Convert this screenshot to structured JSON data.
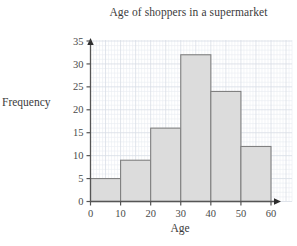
{
  "chart_data": {
    "type": "bar",
    "title": "Age of shoppers in a supermarket",
    "xlabel": "Age",
    "ylabel": "Frequency",
    "categories": [
      "0-10",
      "10-20",
      "20-30",
      "30-40",
      "40-50",
      "50-60"
    ],
    "bin_edges": [
      0,
      10,
      20,
      30,
      40,
      50,
      60
    ],
    "values": [
      5,
      9,
      16,
      32,
      24,
      12
    ],
    "xlim": [
      0,
      67
    ],
    "ylim": [
      0,
      38
    ],
    "xticks": [
      0,
      10,
      20,
      30,
      40,
      50,
      60
    ],
    "yticks": [
      0,
      5,
      10,
      15,
      20,
      25,
      30,
      35
    ],
    "xtick_labels": [
      "0",
      "10",
      "20",
      "30",
      "40",
      "50",
      "60"
    ],
    "ytick_labels": [
      "0",
      "5",
      "10",
      "15",
      "20",
      "25",
      "30",
      "35"
    ],
    "grid": true,
    "minor_grid": true,
    "minor_grid_step": 1,
    "major_grid_step": 5,
    "legend": null,
    "bar_fill_color": "#dcdcdc",
    "bar_edge_color": "#808080",
    "axis_color": "#555555",
    "grid_color": "#e9ecf2",
    "major_grid_color": "#d8dde6",
    "text_color": "#3b3b3b"
  }
}
